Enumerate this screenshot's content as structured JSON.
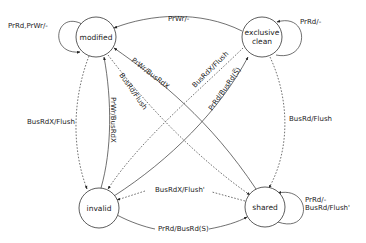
{
  "diagram": {
    "type": "state-machine",
    "nodes": {
      "modified": {
        "label": "modified"
      },
      "exclusive_line1": "exclusive",
      "exclusive_line2": "clean",
      "invalid": {
        "label": "invalid"
      },
      "shared": {
        "label": "shared"
      }
    },
    "edges": {
      "modified_self": "PrRd,PrWr/-",
      "exclusive_self": "PrRd/-",
      "shared_self_line1": "PrRd/-",
      "shared_self_line2": "BusRd/Flush'",
      "exclusive_to_modified": "PrWr/-",
      "shared_to_modified": "PrWr/BusRdX",
      "modified_to_shared": "BusRd/Flush",
      "invalid_to_modified": "PrWr/BusRdX",
      "modified_to_invalid": "BusRdX/Flush",
      "exclusive_to_invalid": "BusRdX/Flush",
      "invalid_to_exclusive": "PrRd/BusRd(S̅)",
      "exclusive_to_shared": "BusRd/Flush",
      "shared_to_invalid": "BusRdX/Flush'",
      "invalid_to_shared": "PrRd/BusRd(S)"
    }
  }
}
